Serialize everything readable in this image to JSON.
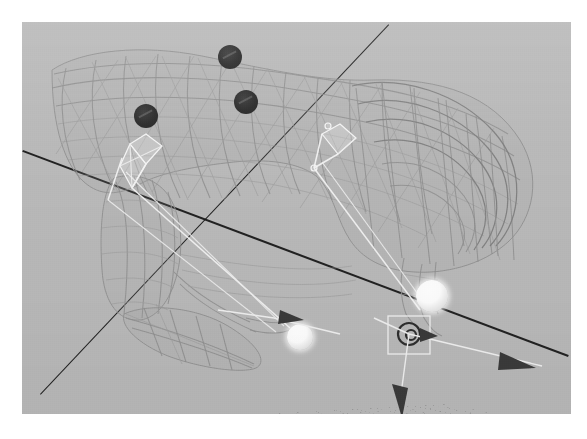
{
  "app": {
    "kind": "3d-viewport-screenshot",
    "title": "3D Viewport",
    "shading_mode": "Wireframe",
    "view_label": "User Perspective"
  },
  "viewport": {
    "x": 22,
    "y": 22,
    "width": 549,
    "height": 392,
    "background_color": "#b9b9b9",
    "page_background_color": "#ffffff"
  },
  "grid": {
    "name": "ground-grid",
    "line_color": "#787878",
    "visible": true,
    "spacing_label": "1 m",
    "divisions": 26
  },
  "axes": [
    {
      "name": "axis-line-primary",
      "label": "X axis",
      "color": "#161616",
      "x1": 1,
      "y1": 128,
      "x2": 548,
      "y2": 334
    },
    {
      "name": "axis-line-secondary",
      "label": "Y axis",
      "color": "#161616",
      "x1": 18,
      "y1": 372,
      "x2": 366,
      "y2": 2
    }
  ],
  "subject": {
    "name": "quadruped-wireframe-mesh",
    "label": "Quadruped mesh (wireframe)",
    "wire_color": "#8e8e8e"
  },
  "armature": {
    "name": "armature-rig",
    "label": "Armature",
    "bone_color": "#f2f2f2",
    "bone_count_visible": 6
  },
  "empties": [
    {
      "name": "empty-marker-1",
      "label": "Empty.001",
      "cx": 208,
      "cy": 35,
      "r": 12,
      "color": "#2b2b2b"
    },
    {
      "name": "empty-marker-2",
      "label": "Empty.002",
      "cx": 224,
      "cy": 80,
      "r": 12,
      "color": "#2b2b2b"
    },
    {
      "name": "empty-marker-3",
      "label": "Empty.003",
      "cx": 124,
      "cy": 94,
      "r": 12,
      "color": "#2b2b2b"
    }
  ],
  "ik_targets": [
    {
      "name": "ik-target-front",
      "label": "IK.Foot.L",
      "cx": 278,
      "cy": 315,
      "r": 13,
      "color": "#ffffff"
    },
    {
      "name": "ik-target-rear",
      "label": "IK.Foot.R",
      "cx": 410,
      "cy": 274,
      "r": 16,
      "color": "#ffffff"
    }
  ],
  "gizmos": [
    {
      "name": "transform-gizmo-rear",
      "label": "Translate / Rotate manipulator",
      "origin_x": 391,
      "origin_y": 310,
      "handle_color": "#efefef",
      "arrow_color": "#3a3a3a",
      "handles": [
        {
          "name": "gizmo-arrow-x",
          "label": "X handle",
          "direction": "right"
        },
        {
          "name": "gizmo-arrow-z",
          "label": "Z handle",
          "direction": "down"
        }
      ]
    },
    {
      "name": "transform-gizmo-front",
      "label": "Translate manipulator",
      "origin_x": 270,
      "origin_y": 300,
      "handle_color": "#efefef",
      "arrow_color": "#3a3a3a",
      "handles": [
        {
          "name": "gizmo-arrow-x2",
          "label": "X handle",
          "direction": "right"
        }
      ]
    }
  ],
  "selection": {
    "name": "selection-box",
    "label": "Active object outline",
    "color": "#f0f0f0"
  }
}
